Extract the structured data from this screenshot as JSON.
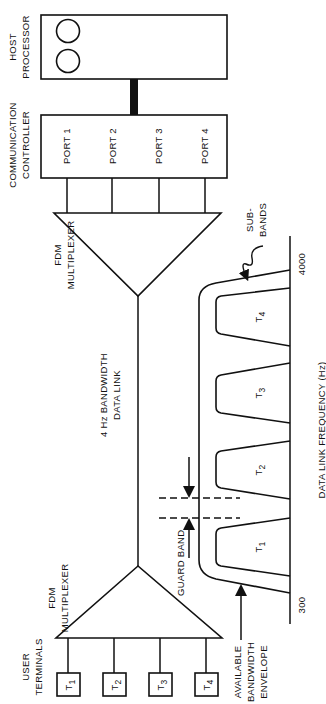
{
  "host": {
    "title_line1": "HOST",
    "title_line2": "PROCESSOR"
  },
  "controller": {
    "title_line1": "COMMUNICATION",
    "title_line2": "CONTROLLER",
    "ports": [
      "PORT 1",
      "PORT 2",
      "PORT 3",
      "PORT 4"
    ]
  },
  "mux_top": {
    "line1": "FDM",
    "line2": "MULTIPLEXER"
  },
  "mux_bottom": {
    "line1": "FDM",
    "line2": "MULTIPLEXER"
  },
  "link": {
    "line1": "4 Hz BANDWIDTH",
    "line2": "DATA LINK"
  },
  "terminals": {
    "title_line1": "USER",
    "title_line2": "TERMINALS",
    "items": [
      "T",
      "T",
      "T",
      "T"
    ],
    "subs": [
      "1",
      "2",
      "3",
      "4"
    ]
  },
  "spectrum": {
    "subbands": [
      "T",
      "T",
      "T",
      "T"
    ],
    "subband_subs": [
      "1",
      "2",
      "3",
      "4"
    ],
    "freq_low": "300",
    "freq_high": "4000",
    "axis_label": "DATA LINK FREQUENCY (Hz)",
    "guard_band": "GUARD BAND",
    "sub_bands_line1": "SUB-",
    "sub_bands_line2": "BANDS",
    "envelope_line1": "AVAILABLE",
    "envelope_line2": "BANDWIDTH",
    "envelope_line3": "ENVELOPE"
  }
}
